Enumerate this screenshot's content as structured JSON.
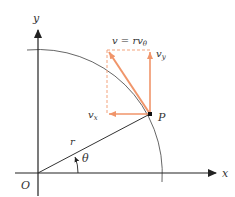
{
  "diagram": {
    "labels": {
      "y_axis": "y",
      "x_axis": "x",
      "origin": "O",
      "point": "P",
      "radius": "r",
      "angle": "θ",
      "velocity": "v = rv",
      "velocity_sub": "θ",
      "vx": "v",
      "vx_sub": "x",
      "vy": "v",
      "vy_sub": "y"
    },
    "colors": {
      "axis": "#222222",
      "vector": "#f0956a",
      "dashed": "#f3a37d",
      "arc": "#555555",
      "point": "#111111"
    }
  }
}
